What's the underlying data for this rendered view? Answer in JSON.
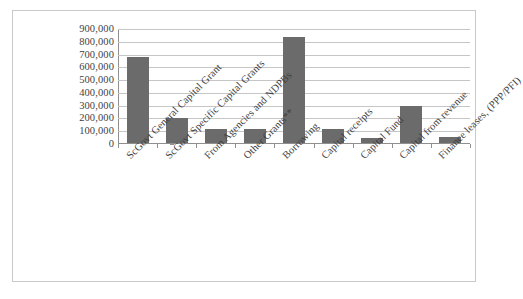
{
  "chart_data": {
    "type": "bar",
    "title": "",
    "subtitle": "",
    "xlabel": "",
    "ylabel": "",
    "ylim": [
      0,
      900000
    ],
    "ytick_interval": 100000,
    "grid": true,
    "legend": false,
    "legend_position": "none",
    "orientation": "vertical",
    "bar_color": "#6b6b6b",
    "gridline_color": "#c6c6c6",
    "axis_color": "#8f8f8f",
    "frame_color": "#c9c9c9",
    "background_color": "#ffffff",
    "ytick_labels": [
      "900,000",
      "800,000",
      "700,000",
      "600,000",
      "500,000",
      "400,000",
      "300,000",
      "200,000",
      "100,000",
      "0"
    ],
    "ytick_values": [
      900000,
      800000,
      700000,
      600000,
      500000,
      400000,
      300000,
      200000,
      100000,
      0
    ],
    "categories": [
      "ScGovt General Capital Grant",
      "ScGovt Specific Capital Grants",
      "From Agencies and NDPBs",
      "Other Grants**",
      "Borrowing",
      "Capital receipts",
      "Capital Fund",
      "Capital from revenue",
      "Finance leases, (PPP/PFI)"
    ],
    "values": [
      680000,
      205000,
      115000,
      115000,
      835000,
      120000,
      45000,
      300000,
      55000
    ],
    "label_rotation_degrees": -45
  },
  "caption": {
    "cut_off_text": ""
  }
}
